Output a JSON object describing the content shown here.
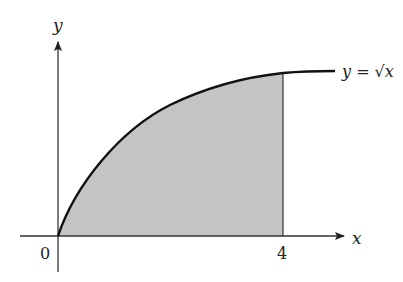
{
  "diagram": {
    "function_label": "y = √x",
    "axes": {
      "x_label": "x",
      "y_label": "y"
    },
    "ticks": {
      "origin": "0",
      "x_end": "4"
    },
    "shaded_region": "area under y = √x from x = 0 to x = 4",
    "colors": {
      "shade": "#c4c4c4",
      "curve": "#111111",
      "axis": "#333333"
    }
  }
}
